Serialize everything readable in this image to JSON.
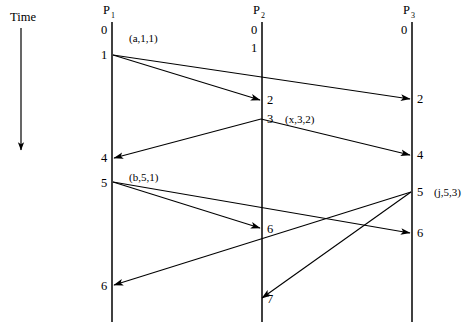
{
  "figure": {
    "type": "space-time-diagram",
    "time_axis": {
      "label": "Time",
      "direction": "downward",
      "x": 21,
      "y_start": 28,
      "y_end": 150
    },
    "processes": [
      {
        "id": "P1",
        "name": "P",
        "subscript": "1",
        "x": 112,
        "name_y": 14,
        "line_top": 22,
        "line_bottom": 322
      },
      {
        "id": "P2",
        "name": "P",
        "subscript": "2",
        "x": 262,
        "name_y": 14,
        "line_top": 22,
        "line_bottom": 322
      },
      {
        "id": "P3",
        "name": "P",
        "subscript": "3",
        "x": 412,
        "name_y": 14,
        "line_top": 22,
        "line_bottom": 322
      }
    ],
    "clock_ticks": [
      {
        "process": "P1",
        "value": "0",
        "x": 104,
        "y": 34
      },
      {
        "process": "P1",
        "value": "1",
        "x": 104,
        "y": 59
      },
      {
        "process": "P1",
        "value": "4",
        "x": 104,
        "y": 162
      },
      {
        "process": "P1",
        "value": "5",
        "x": 104,
        "y": 187
      },
      {
        "process": "P1",
        "value": "6",
        "x": 104,
        "y": 290
      },
      {
        "process": "P2",
        "value": "0",
        "x": 254,
        "y": 34
      },
      {
        "process": "P2",
        "value": "1",
        "x": 254,
        "y": 52
      },
      {
        "process": "P2",
        "value": "2",
        "x": 269,
        "y": 104
      },
      {
        "process": "P2",
        "value": "3",
        "x": 269,
        "y": 123
      },
      {
        "process": "P2",
        "value": "6",
        "x": 269,
        "y": 233
      },
      {
        "process": "P2",
        "value": "7",
        "x": 269,
        "y": 303
      },
      {
        "process": "P3",
        "value": "0",
        "x": 404,
        "y": 34
      },
      {
        "process": "P3",
        "value": "2",
        "x": 419,
        "y": 103
      },
      {
        "process": "P3",
        "value": "4",
        "x": 419,
        "y": 159
      },
      {
        "process": "P3",
        "value": "5",
        "x": 419,
        "y": 196
      },
      {
        "process": "P3",
        "value": "6",
        "x": 419,
        "y": 237
      }
    ],
    "event_labels": [
      {
        "text": "(a,1,1)",
        "x": 129,
        "y": 42
      },
      {
        "text": "(x,3,2)",
        "x": 287,
        "y": 123
      },
      {
        "text": "(b,5,1)",
        "x": 129,
        "y": 181
      },
      {
        "text": "(j,5,3)",
        "x": 437,
        "y": 196
      }
    ],
    "messages": [
      {
        "name": "a-from-p1-to-p2",
        "x1": 113,
        "y1": 55,
        "x2": 260,
        "y2": 100
      },
      {
        "name": "a-from-p1-to-p3",
        "x1": 113,
        "y1": 55,
        "x2": 410,
        "y2": 99
      },
      {
        "name": "x-from-p2-to-p1",
        "x1": 261,
        "y1": 119,
        "x2": 114,
        "y2": 158
      },
      {
        "name": "x-from-p2-to-p3",
        "x1": 261,
        "y1": 119,
        "x2": 410,
        "y2": 155
      },
      {
        "name": "b-from-p1-to-p2",
        "x1": 113,
        "y1": 182,
        "x2": 260,
        "y2": 228
      },
      {
        "name": "b-from-p1-to-p3",
        "x1": 113,
        "y1": 182,
        "x2": 410,
        "y2": 233
      },
      {
        "name": "j-from-p3-to-p1",
        "x1": 411,
        "y1": 192,
        "x2": 114,
        "y2": 285
      },
      {
        "name": "j-from-p3-to-p2",
        "x1": 411,
        "y1": 192,
        "x2": 262,
        "y2": 298
      }
    ]
  }
}
